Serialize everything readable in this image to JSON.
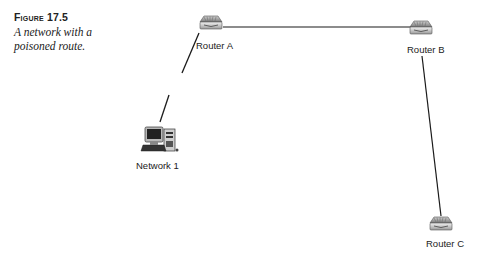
{
  "figure": {
    "number": "Figure 17.5",
    "number_prefix": "F",
    "number_rest": "IGURE",
    "number_value": "17.5",
    "description": "A network with a poisoned route."
  },
  "nodes": [
    {
      "id": "router-a",
      "label": "Router A",
      "type": "router",
      "x": 213,
      "y": 26
    },
    {
      "id": "router-b",
      "label": "Router B",
      "type": "router",
      "x": 421,
      "y": 31
    },
    {
      "id": "router-c",
      "label": "Router C",
      "type": "router",
      "x": 441,
      "y": 226
    },
    {
      "id": "network-1",
      "label": "Network 1",
      "type": "computer",
      "x": 162,
      "y": 148
    }
  ],
  "links": [
    {
      "from": "router-a",
      "to": "router-b",
      "state": "connected"
    },
    {
      "from": "router-b",
      "to": "router-c",
      "state": "connected"
    },
    {
      "from": "router-a",
      "to": "network-1",
      "state": "broken"
    }
  ],
  "colors": {
    "line": "#1a1a1a",
    "router": "#8a8a8a",
    "text": "#222222"
  }
}
